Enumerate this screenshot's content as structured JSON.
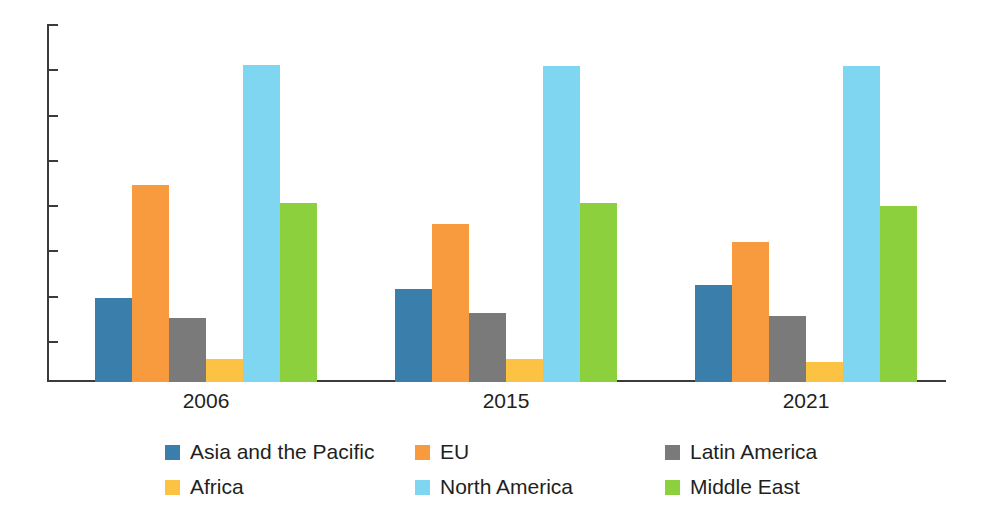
{
  "chart_data": {
    "type": "bar",
    "title": "",
    "subtitle": "",
    "xlabel": "",
    "ylabel": "",
    "categories": [
      "2006",
      "2015",
      "2021"
    ],
    "series": [
      {
        "name": "Asia and the Pacific",
        "color": "#3a7fac",
        "values": [
          3.7,
          4.1,
          4.3
        ]
      },
      {
        "name": "EU",
        "color": "#f79b3e",
        "values": [
          8.7,
          7.0,
          6.2
        ]
      },
      {
        "name": "Latin America",
        "color": "#7a7a7a",
        "values": [
          2.85,
          3.05,
          2.9
        ]
      },
      {
        "name": "Africa",
        "color": "#fcc243",
        "values": [
          1.0,
          1.0,
          0.9
        ]
      },
      {
        "name": "North America",
        "color": "#7fd6f0",
        "values": [
          14.0,
          13.95,
          13.95
        ]
      },
      {
        "name": "Middle East",
        "color": "#8cd03e",
        "values": [
          7.9,
          7.9,
          7.8
        ]
      }
    ],
    "ylim": [
      0,
      16
    ],
    "yticks": [
      0,
      2,
      4,
      6,
      8,
      10,
      12,
      14,
      16
    ],
    "ytick_labels": [
      "0",
      "2",
      "4",
      "6",
      "8",
      "10",
      "12",
      "14",
      "16"
    ],
    "grid": false,
    "legend_position": "bottom",
    "legend_columns": 3,
    "legend_rows": 2,
    "axis_color": "#3b3b3b",
    "text_color": "#231f20",
    "background": "#ffffff"
  },
  "legend": {
    "entries": [
      {
        "label": "Asia and the Pacific",
        "color": "#3a7fac"
      },
      {
        "label": "EU",
        "color": "#f79b3e"
      },
      {
        "label": "Latin America",
        "color": "#7a7a7a"
      },
      {
        "label": "Africa",
        "color": "#fcc243"
      },
      {
        "label": "North America",
        "color": "#7fd6f0"
      },
      {
        "label": "Middle East",
        "color": "#8cd03e"
      }
    ]
  }
}
